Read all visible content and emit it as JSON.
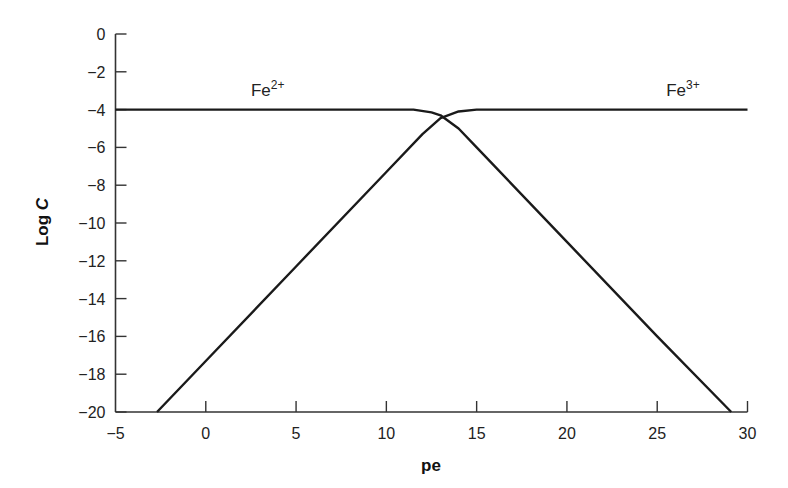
{
  "chart_data": {
    "type": "line",
    "title": "",
    "xlabel": "pe",
    "ylabel": "Log C",
    "xlim": [
      -5,
      30
    ],
    "ylim": [
      -20,
      0
    ],
    "xticks": [
      -5,
      0,
      5,
      10,
      15,
      20,
      25,
      30
    ],
    "yticks": [
      0,
      -2,
      -4,
      -6,
      -8,
      -10,
      -12,
      -14,
      -16,
      -18,
      -20
    ],
    "grid": false,
    "legend": "inline labels",
    "series": [
      {
        "name": "Fe2+",
        "label_base": "Fe",
        "label_sup": "2+",
        "points": [
          [
            -5,
            -4
          ],
          [
            11.5,
            -4.0
          ],
          [
            12.5,
            -4.15
          ],
          [
            13,
            -4.3
          ],
          [
            14,
            -5.0
          ],
          [
            15,
            -6
          ],
          [
            20,
            -11
          ],
          [
            25,
            -16
          ],
          [
            29.1,
            -20
          ]
        ]
      },
      {
        "name": "Fe3+",
        "label_base": "Fe",
        "label_sup": "3+",
        "points": [
          [
            -2.7,
            -20
          ],
          [
            0,
            -17.3
          ],
          [
            5,
            -12.3
          ],
          [
            10,
            -7.3
          ],
          [
            12,
            -5.3
          ],
          [
            13,
            -4.45
          ],
          [
            14,
            -4.1
          ],
          [
            15,
            -4.0
          ],
          [
            30,
            -4.0
          ]
        ]
      }
    ],
    "annotations": [
      {
        "text": "Fe2+",
        "x": 2.5,
        "y": -3.3
      },
      {
        "text": "Fe3+",
        "x": 25.5,
        "y": -3.3
      }
    ]
  }
}
